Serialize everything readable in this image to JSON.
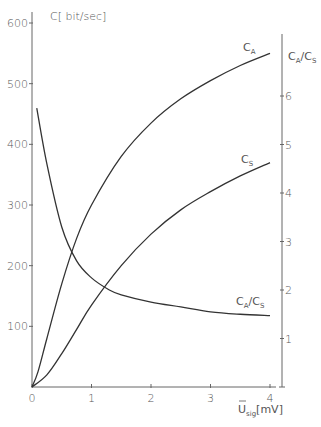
{
  "chart_data": {
    "type": "line",
    "title": "",
    "xlabel": "Ū_sig [mV]",
    "ylabel": "C [bit/sec]",
    "y2label": "C_A/C_S",
    "xlim": [
      0,
      4
    ],
    "ylim": [
      0,
      600
    ],
    "y2lim": [
      0,
      7.5
    ],
    "grid": false,
    "x_ticks": [
      "0",
      "1",
      "2",
      "3",
      "4"
    ],
    "y_ticks": [
      "100",
      "200",
      "300",
      "400",
      "500",
      "600"
    ],
    "y2_ticks": [
      "1",
      "2",
      "3",
      "4",
      "5",
      "6"
    ],
    "series": [
      {
        "name": "C_A",
        "axis": "left",
        "x": [
          0,
          0.1,
          0.25,
          0.5,
          0.75,
          1.0,
          1.5,
          2.0,
          2.5,
          3.0,
          3.5,
          4.0
        ],
        "y": [
          0,
          25,
          80,
          170,
          245,
          300,
          380,
          435,
          475,
          505,
          530,
          550
        ]
      },
      {
        "name": "C_S",
        "axis": "left",
        "x": [
          0,
          0.25,
          0.5,
          0.75,
          1.0,
          1.5,
          2.0,
          2.5,
          3.0,
          3.5,
          4.0
        ],
        "y": [
          0,
          20,
          55,
          95,
          135,
          200,
          252,
          292,
          322,
          348,
          370
        ]
      },
      {
        "name": "C_A/C_S",
        "axis": "right",
        "x": [
          0.08,
          0.25,
          0.5,
          0.75,
          1.0,
          1.3,
          1.5,
          2.0,
          2.5,
          3.0,
          3.5,
          4.0
        ],
        "y": [
          5.75,
          4.6,
          3.3,
          2.6,
          2.25,
          2.0,
          1.9,
          1.75,
          1.65,
          1.55,
          1.5,
          1.47
        ]
      }
    ]
  },
  "labels": {
    "y_axis_title": "C[ bit/sec]",
    "y2_axis_title_main_a": "C",
    "y2_axis_title_sub_a": "A",
    "y2_axis_title_main_s": "C",
    "y2_axis_title_sub_s": "S",
    "x_axis_title_main": "U",
    "x_axis_title_sub": "sig",
    "x_axis_title_unit": "[mV]",
    "curve_ca_main": "C",
    "curve_ca_sub": "A",
    "curve_cs_main": "C",
    "curve_cs_sub": "S",
    "curve_ratio_main_a": "C",
    "curve_ratio_sub_a": "A",
    "curve_ratio_main_s": "C",
    "curve_ratio_sub_s": "S"
  }
}
